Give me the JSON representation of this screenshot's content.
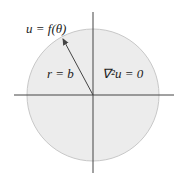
{
  "labels": {
    "boundary": "u = f(θ)",
    "radius": "r = b",
    "equation": "∇²u = 0"
  },
  "colors": {
    "disk_fill": "#ececec",
    "disk_stroke": "#c8c8c8",
    "axes": "#444444"
  }
}
